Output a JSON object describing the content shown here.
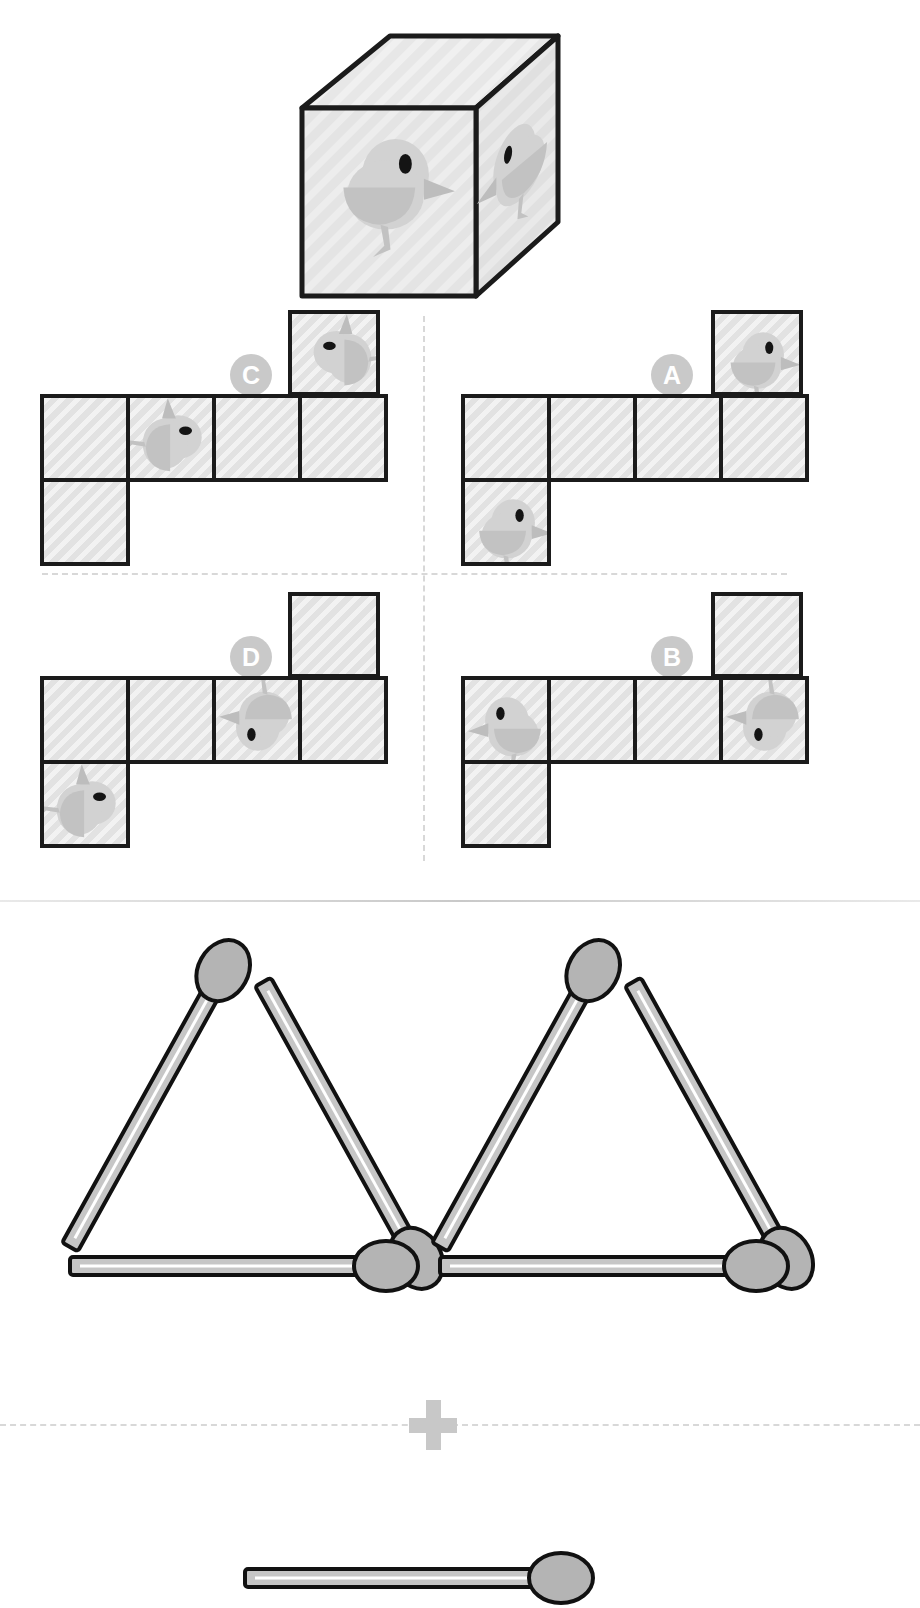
{
  "puzzle": {
    "title": "Cube net matching puzzle",
    "prompt_cube": {
      "name": "reference-cube",
      "faces": [
        {
          "position": "front",
          "motif": "bird",
          "orientation": "upright-facing-right"
        },
        {
          "position": "right",
          "motif": "bird",
          "orientation": "mirrored-facing-left"
        },
        {
          "position": "top",
          "motif": "blank"
        }
      ]
    },
    "options": [
      {
        "id": "C",
        "label": "C",
        "quadrant": "top-left",
        "layout": "T-tetromino-net",
        "cells": [
          {
            "index": 0,
            "row": "top",
            "col": 3,
            "motif": "bird",
            "orientation": "rotated-ccw-head-right"
          },
          {
            "index": 1,
            "row": "middle",
            "col": 0,
            "motif": "blank"
          },
          {
            "index": 2,
            "row": "middle",
            "col": 1,
            "motif": "bird",
            "orientation": "rotated-cw-head-left"
          },
          {
            "index": 3,
            "row": "middle",
            "col": 2,
            "motif": "blank"
          },
          {
            "index": 4,
            "row": "middle",
            "col": 3,
            "motif": "blank"
          },
          {
            "index": 5,
            "row": "bottom",
            "col": 0,
            "motif": "blank"
          }
        ]
      },
      {
        "id": "A",
        "label": "A",
        "quadrant": "top-right",
        "layout": "T-tetromino-net",
        "cells": [
          {
            "index": 0,
            "row": "top",
            "col": 3,
            "motif": "bird",
            "orientation": "upright-facing-right"
          },
          {
            "index": 1,
            "row": "middle",
            "col": 0,
            "motif": "blank"
          },
          {
            "index": 2,
            "row": "middle",
            "col": 1,
            "motif": "blank"
          },
          {
            "index": 3,
            "row": "middle",
            "col": 2,
            "motif": "blank"
          },
          {
            "index": 4,
            "row": "middle",
            "col": 3,
            "motif": "blank"
          },
          {
            "index": 5,
            "row": "bottom",
            "col": 0,
            "motif": "bird",
            "orientation": "upright-facing-right"
          }
        ]
      },
      {
        "id": "D",
        "label": "D",
        "quadrant": "bottom-left",
        "layout": "T-tetromino-net",
        "cells": [
          {
            "index": 0,
            "row": "top",
            "col": 3,
            "motif": "blank"
          },
          {
            "index": 1,
            "row": "middle",
            "col": 0,
            "motif": "blank"
          },
          {
            "index": 2,
            "row": "middle",
            "col": 1,
            "motif": "blank"
          },
          {
            "index": 3,
            "row": "middle",
            "col": 2,
            "motif": "bird",
            "orientation": "upside-down-head-right"
          },
          {
            "index": 4,
            "row": "middle",
            "col": 3,
            "motif": "blank"
          },
          {
            "index": 5,
            "row": "bottom",
            "col": 0,
            "motif": "bird",
            "orientation": "rotated-cw-head-left"
          }
        ]
      },
      {
        "id": "B",
        "label": "B",
        "quadrant": "bottom-right",
        "layout": "T-tetromino-net",
        "cells": [
          {
            "index": 0,
            "row": "top",
            "col": 3,
            "motif": "blank"
          },
          {
            "index": 1,
            "row": "middle",
            "col": 0,
            "motif": "bird",
            "orientation": "upright-facing-left"
          },
          {
            "index": 2,
            "row": "middle",
            "col": 1,
            "motif": "blank"
          },
          {
            "index": 3,
            "row": "middle",
            "col": 2,
            "motif": "blank"
          },
          {
            "index": 4,
            "row": "middle",
            "col": 3,
            "motif": "bird",
            "orientation": "upside-down-head-right"
          },
          {
            "index": 5,
            "row": "bottom",
            "col": 0,
            "motif": "blank"
          }
        ]
      }
    ]
  },
  "matchstick_puzzle": {
    "name": "matchstick-equation",
    "operator": "+",
    "left_group": {
      "shape": "two-adjacent-triangles",
      "triangle_count": 2,
      "match_count": 6,
      "triangles": [
        {
          "index": 0,
          "position": "left",
          "matches": 3
        },
        {
          "index": 1,
          "position": "right",
          "matches": 3
        }
      ]
    },
    "bottom_group": {
      "shape": "single-horizontal-match",
      "match_count": 1,
      "partially_visible": true
    }
  },
  "colors": {
    "cell_fill": "#e2e2e2",
    "cell_border": "#1b1b1b",
    "label_badge": "#c9c9c9",
    "label_text": "#ffffff",
    "bird_body": "#d4d4d4",
    "bird_shade": "#bdbdbd",
    "bird_eye": "#111111",
    "match_stick": "#c6c6c6",
    "match_head": "#b0b0b0",
    "match_outline": "#111111",
    "divider": "#d8d8d8",
    "background": "#ffffff"
  }
}
